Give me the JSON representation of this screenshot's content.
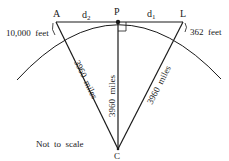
{
  "diagram": {
    "points": {
      "A": "A",
      "P": "P",
      "L": "L",
      "C": "C"
    },
    "segments": {
      "d2": "d",
      "d2_sub": "2",
      "d1": "d",
      "d1_sub": "1"
    },
    "heights": {
      "left": "10,000  feet",
      "right": "362  feet"
    },
    "radii": {
      "left": "3960  miles",
      "center": "3960  miles",
      "right": "3960  miles"
    },
    "note": "Not  to  scale",
    "colors": {
      "line": "#1a1a1a",
      "background": "#ffffff"
    }
  }
}
